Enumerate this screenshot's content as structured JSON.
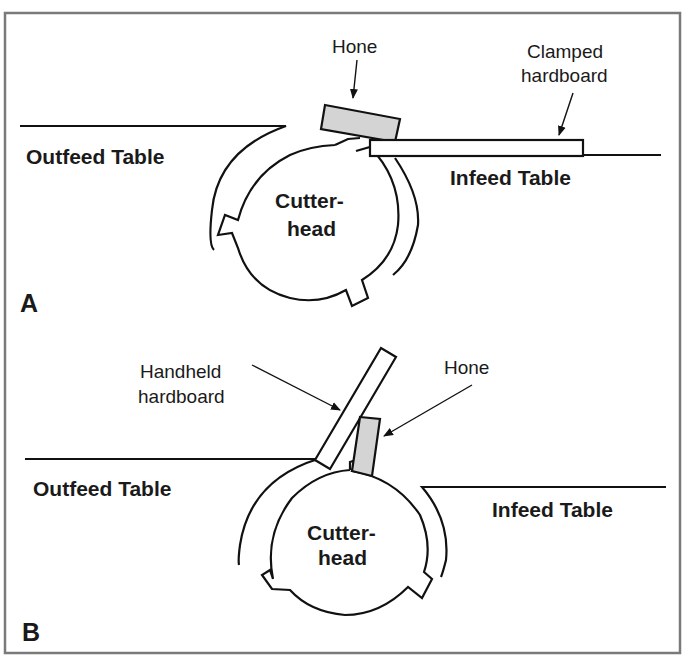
{
  "figure": {
    "frame_color": "#7a7a7a",
    "hone_fill": "#d4d4d4",
    "line_color": "#111111"
  },
  "panel_a": {
    "letter": "A",
    "hone_label": "Hone",
    "clamped_label_line1": "Clamped",
    "clamped_label_line2": "hardboard",
    "outfeed_label": "Outfeed Table",
    "infeed_label": "Infeed Table",
    "cutterhead_line1": "Cutter-",
    "cutterhead_line2": "head"
  },
  "panel_b": {
    "letter": "B",
    "handheld_label_line1": "Handheld",
    "handheld_label_line2": "hardboard",
    "hone_label": "Hone",
    "outfeed_label": "Outfeed Table",
    "infeed_label": "Infeed Table",
    "cutterhead_line1": "Cutter-",
    "cutterhead_line2": "head"
  }
}
